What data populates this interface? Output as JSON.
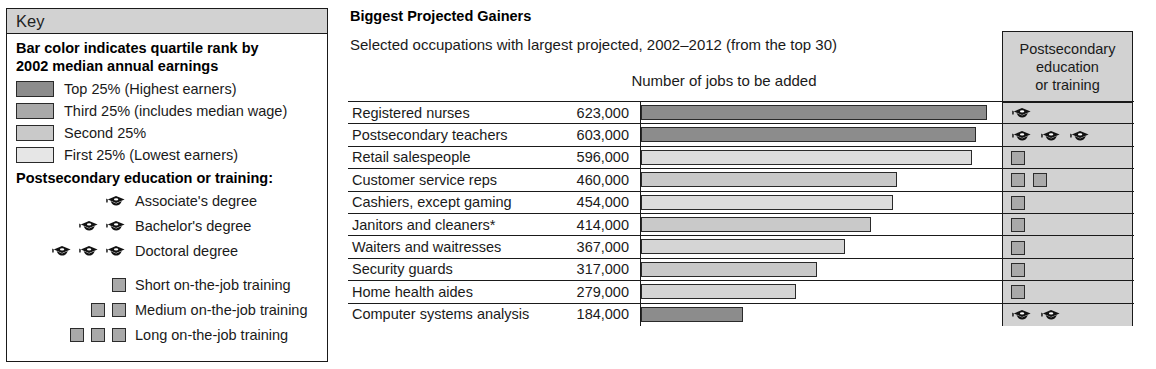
{
  "key": {
    "header": "Key",
    "title_line1": "Bar color indicates quartile rank by",
    "title_line2": "2002 median annual earnings",
    "quartiles": [
      {
        "label": "Top 25% (Highest earners)",
        "color": "#8c8c8c"
      },
      {
        "label": "Third 25% (includes median wage)",
        "color": "#a9a9a9"
      },
      {
        "label": "Second 25%",
        "color": "#c9c9c9"
      },
      {
        "label": "First 25% (Lowest earners)",
        "color": "#e6e6e6"
      }
    ],
    "edu_subtitle": "Postsecondary education or training:",
    "edu_items": [
      {
        "label": "Associate's degree",
        "caps": 1
      },
      {
        "label": "Bachelor's degree",
        "caps": 2
      },
      {
        "label": "Doctoral degree",
        "caps": 3
      }
    ],
    "training_items": [
      {
        "label": "Short on-the-job training",
        "squares": 1
      },
      {
        "label": "Medium on-the-job training",
        "squares": 2
      },
      {
        "label": "Long on-the-job training",
        "squares": 3
      }
    ]
  },
  "chart": {
    "title": "Biggest Projected Gainers",
    "subtitle": "Selected occupations with largest projected, 2002–2012 (from the top 30)",
    "axis_caption": "Number of jobs to be added",
    "edu_col_header_line1": "Postsecondary",
    "edu_col_header_line2": "education",
    "edu_col_header_line3": "or training"
  },
  "chart_data": {
    "type": "bar",
    "title": "Biggest Projected Gainers",
    "subtitle": "Selected occupations with largest projected, 2002–2012 (from the top 30)",
    "xlabel": "Number of jobs to be added",
    "ylabel": "",
    "orientation": "horizontal",
    "grid": false,
    "legend": "Key panel at left: bar color indicates quartile rank by 2002 median annual earnings",
    "xlim": [
      0,
      640000
    ],
    "categories": [
      "Registered nurses",
      "Postsecondary teachers",
      "Retail salespeople",
      "Customer service reps",
      "Cashiers, except gaming",
      "Janitors and cleaners*",
      "Waiters and waitresses",
      "Security guards",
      "Home health aides",
      "Computer systems analysis"
    ],
    "values": [
      623000,
      603000,
      596000,
      460000,
      454000,
      414000,
      367000,
      317000,
      279000,
      184000
    ],
    "value_labels": [
      "623,000",
      "603,000",
      "596,000",
      "460,000",
      "454,000",
      "414,000",
      "367,000",
      "317,000",
      "279,000",
      "184,000"
    ],
    "rows": [
      {
        "name": "Registered nurses",
        "value_label": "623,000",
        "value": 623000,
        "quartile": "Top 25% (Highest earners)",
        "bar_color": "#8c8c8c",
        "bar_pct": 97.2,
        "edu_type": "degree",
        "edu_count": 1,
        "edu_label": "Associate's degree"
      },
      {
        "name": "Postsecondary teachers",
        "value_label": "603,000",
        "value": 603000,
        "quartile": "Top 25% (Highest earners)",
        "bar_color": "#8c8c8c",
        "bar_pct": 94.1,
        "edu_type": "degree",
        "edu_count": 3,
        "edu_label": "Doctoral degree"
      },
      {
        "name": "Retail salespeople",
        "value_label": "596,000",
        "value": 596000,
        "quartile": "First 25% (Lowest earners)",
        "bar_color": "#dcdcdc",
        "bar_pct": 93.0,
        "edu_type": "training",
        "edu_count": 1,
        "edu_label": "Short on-the-job training"
      },
      {
        "name": "Customer service reps",
        "value_label": "460,000",
        "value": 460000,
        "quartile": "Second 25%",
        "bar_color": "#c9c9c9",
        "bar_pct": 71.8,
        "edu_type": "training",
        "edu_count": 2,
        "edu_label": "Medium on-the-job training"
      },
      {
        "name": "Cashiers, except gaming",
        "value_label": "454,000",
        "value": 454000,
        "quartile": "First 25% (Lowest earners)",
        "bar_color": "#dcdcdc",
        "bar_pct": 70.9,
        "edu_type": "training",
        "edu_count": 1,
        "edu_label": "Short on-the-job training"
      },
      {
        "name": "Janitors and cleaners*",
        "value_label": "414,000",
        "value": 414000,
        "quartile": "Second 25%",
        "bar_color": "#c9c9c9",
        "bar_pct": 64.6,
        "edu_type": "training",
        "edu_count": 1,
        "edu_label": "Short on-the-job training"
      },
      {
        "name": "Waiters and waitresses",
        "value_label": "367,000",
        "value": 367000,
        "quartile": "First 25% (Lowest earners)",
        "bar_color": "#d5d5d5",
        "bar_pct": 57.3,
        "edu_type": "training",
        "edu_count": 1,
        "edu_label": "Short on-the-job training"
      },
      {
        "name": "Security guards",
        "value_label": "317,000",
        "value": 317000,
        "quartile": "Second 25%",
        "bar_color": "#c9c9c9",
        "bar_pct": 49.5,
        "edu_type": "training",
        "edu_count": 1,
        "edu_label": "Short on-the-job training"
      },
      {
        "name": "Home health aides",
        "value_label": "279,000",
        "value": 279000,
        "quartile": "First 25% (Lowest earners)",
        "bar_color": "#d5d5d5",
        "bar_pct": 43.6,
        "edu_type": "training",
        "edu_count": 1,
        "edu_label": "Short on-the-job training"
      },
      {
        "name": "Computer systems analysis",
        "value_label": "184,000",
        "value": 184000,
        "quartile": "Top 25% (Highest earners)",
        "bar_color": "#8c8c8c",
        "bar_pct": 28.7,
        "edu_type": "degree",
        "edu_count": 2,
        "edu_label": "Bachelor's degree"
      }
    ]
  }
}
